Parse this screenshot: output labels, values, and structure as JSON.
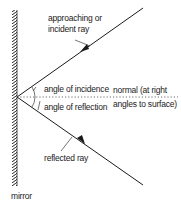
{
  "diagram": {
    "labels": {
      "incident_line1": "approaching or",
      "incident_line2": "incident ray",
      "angle_incidence": "angle of incidence",
      "angle_reflection": "angle of reflection",
      "normal_line1": "normal (at right",
      "normal_line2": "angles to surface)",
      "reflected": "reflected ray",
      "mirror": "mirror"
    },
    "colors": {
      "line": "#1a1a1a",
      "text": "#222222",
      "background": "#ffffff"
    }
  }
}
